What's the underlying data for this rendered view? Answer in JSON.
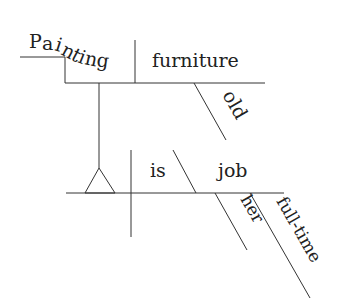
{
  "diagram": {
    "type": "sentence-diagram",
    "words": {
      "painting_letters": [
        "P",
        "a",
        "i",
        "n",
        "t",
        "i",
        "n",
        "g"
      ],
      "furniture": "furniture",
      "old": "old",
      "is": "is",
      "job": "job",
      "her": "her",
      "full_time": "full-time"
    },
    "colors": {
      "line": "#333333",
      "text": "#222222",
      "background": "#ffffff"
    }
  }
}
